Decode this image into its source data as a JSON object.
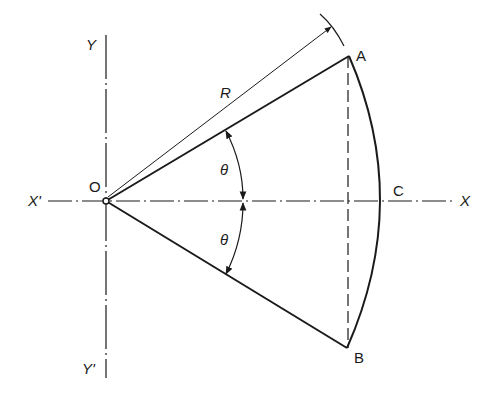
{
  "diagram": {
    "labels": {
      "origin": "O",
      "point_a": "A",
      "point_b": "B",
      "point_c": "C",
      "axis_x": "X",
      "axis_x_neg": "X'",
      "axis_y": "Y",
      "axis_y_neg": "Y'",
      "radius": "R",
      "angle_upper": "θ",
      "angle_lower": "θ"
    },
    "colors": {
      "line": "#1a1a1a",
      "background": "#ffffff"
    }
  }
}
